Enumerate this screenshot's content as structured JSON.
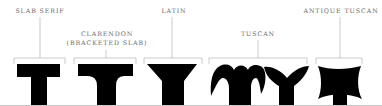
{
  "diagram": {
    "labels": {
      "slab_serif": "SLAB SERIF",
      "clarendon_line1": "CLARENDON",
      "clarendon_line2": "(BRACKETED SLAB)",
      "latin": "LATIN",
      "tuscan": "TUSCAN",
      "antique_tuscan": "ANTIQUE TUSCAN"
    },
    "colors": {
      "glyph": "#000000",
      "label_text": "#6b6b6b",
      "leader_line": "#b5b5b5",
      "baseline": "#c8c8c8"
    }
  }
}
